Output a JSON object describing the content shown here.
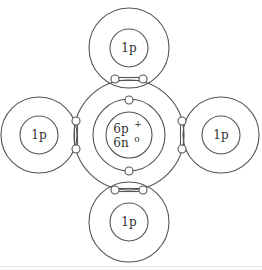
{
  "diagram": {
    "colors": {
      "stroke": "#555555",
      "text": "#333333",
      "background": "#ffffff"
    },
    "carbon": {
      "nucleus_label_line1": "6p",
      "nucleus_charge": "+",
      "nucleus_label_line2": "6n",
      "neutron_mark": "o",
      "inner_shell_electrons": 2,
      "outer_shell_electrons": 8
    },
    "hydrogens": [
      {
        "position": "top",
        "label": "1p"
      },
      {
        "position": "left",
        "label": "1p"
      },
      {
        "position": "right",
        "label": "1p"
      },
      {
        "position": "bottom",
        "label": "1p"
      }
    ]
  }
}
